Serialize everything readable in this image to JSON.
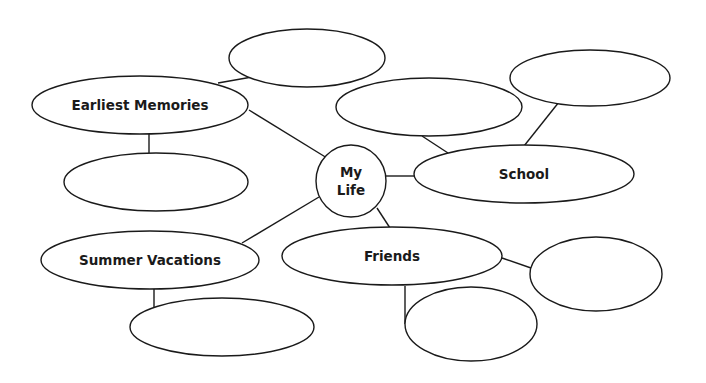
{
  "diagram": {
    "type": "mind-map",
    "center": {
      "id": "my-life",
      "label_line1": "My",
      "label_line2": "Life",
      "cx": 351,
      "cy": 181,
      "rx": 35,
      "ry": 36
    },
    "nodes": [
      {
        "id": "earliest-memories",
        "label": "Earliest Memories",
        "cx": 140,
        "cy": 105,
        "rx": 108,
        "ry": 29
      },
      {
        "id": "school",
        "label": "School",
        "cx": 524,
        "cy": 174,
        "rx": 110,
        "ry": 29
      },
      {
        "id": "summer-vacations",
        "label": "Summer Vacations",
        "cx": 150,
        "cy": 260,
        "rx": 109,
        "ry": 29
      },
      {
        "id": "friends",
        "label": "Friends",
        "cx": 392,
        "cy": 256,
        "rx": 110,
        "ry": 29
      },
      {
        "id": "blank-top",
        "label": "",
        "cx": 307,
        "cy": 58,
        "rx": 78,
        "ry": 29
      },
      {
        "id": "blank-under-memories",
        "label": "",
        "cx": 156,
        "cy": 182,
        "rx": 92,
        "ry": 29
      },
      {
        "id": "blank-school-left",
        "label": "",
        "cx": 429,
        "cy": 107,
        "rx": 93,
        "ry": 29
      },
      {
        "id": "blank-school-right",
        "label": "",
        "cx": 590,
        "cy": 78,
        "rx": 80,
        "ry": 28
      },
      {
        "id": "blank-under-vacations",
        "label": "",
        "cx": 222,
        "cy": 327,
        "rx": 92,
        "ry": 29
      },
      {
        "id": "blank-friends-right",
        "label": "",
        "cx": 596,
        "cy": 274,
        "rx": 66,
        "ry": 37
      },
      {
        "id": "blank-under-friends",
        "label": "",
        "cx": 471,
        "cy": 324,
        "rx": 66,
        "ry": 37
      }
    ],
    "edges": [
      {
        "from": "earliest-memories",
        "to": "blank-top",
        "x1": 218,
        "y1": 83,
        "x2": 252,
        "y2": 77
      },
      {
        "from": "earliest-memories",
        "to": "my-life",
        "x1": 249,
        "y1": 110,
        "x2": 327,
        "y2": 158
      },
      {
        "from": "earliest-memories",
        "to": "blank-under-memories",
        "x1": 149,
        "y1": 134,
        "x2": 149,
        "y2": 153
      },
      {
        "from": "my-life",
        "to": "school",
        "x1": 386,
        "y1": 176,
        "x2": 414,
        "y2": 176
      },
      {
        "from": "blank-school-left",
        "to": "school",
        "x1": 422,
        "y1": 136,
        "x2": 448,
        "y2": 153
      },
      {
        "from": "blank-school-right",
        "to": "school",
        "x1": 559,
        "y1": 102,
        "x2": 524,
        "y2": 146
      },
      {
        "from": "my-life",
        "to": "summer-vacations",
        "x1": 319,
        "y1": 197,
        "x2": 242,
        "y2": 243
      },
      {
        "from": "my-life",
        "to": "friends",
        "x1": 377,
        "y1": 208,
        "x2": 390,
        "y2": 228
      },
      {
        "from": "summer-vacations",
        "to": "blank-under-vacations",
        "x1": 154,
        "y1": 289,
        "x2": 154,
        "y2": 307
      },
      {
        "from": "friends",
        "to": "blank-friends-right",
        "x1": 502,
        "y1": 258,
        "x2": 531,
        "y2": 268
      },
      {
        "from": "friends",
        "to": "blank-under-friends",
        "x1": 405,
        "y1": 286,
        "x2": 405,
        "y2": 324
      }
    ],
    "colors": {
      "stroke": "#1a1a1a",
      "fill": "#ffffff",
      "text": "#1a1a1a"
    }
  }
}
